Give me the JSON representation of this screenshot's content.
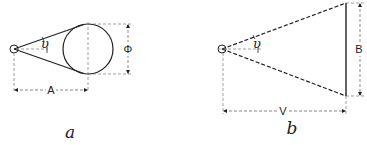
{
  "figure_a": {
    "caption": "a",
    "angle_symbol": "υ",
    "distance_label": "A",
    "diameter_label": "Φ",
    "object_shape": "circle"
  },
  "figure_b": {
    "caption": "b",
    "angle_symbol": "υ",
    "distance_label": "V",
    "height_label": "B",
    "object_shape": "vertical-line"
  },
  "colors": {
    "line": "#222222",
    "dim": "#555555",
    "background": "#ffffff"
  }
}
